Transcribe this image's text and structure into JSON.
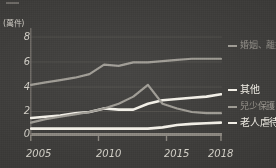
{
  "axis": {
    "unit_label": "(萬件)",
    "y_ticks": [
      "8",
      "6",
      "4",
      "2",
      "0"
    ],
    "x_ticks": [
      "2005",
      "2010",
      "2015",
      "2018"
    ]
  },
  "legend": {
    "marriage": "婚姻、離婚或同居關係暴力",
    "other": "其他",
    "child": "兒少保護",
    "elder": "老人虐待"
  },
  "colors": {
    "background": "#3d3c3a",
    "marriage_line": "#9d9a93",
    "other_line": "#f2efe7",
    "child_line": "#9d9a93",
    "elder_line": "#f2efe7",
    "axis_line": "#85817b",
    "grid_line": "#4a4845",
    "tick_text": "#cfccc4"
  },
  "chart_data": {
    "type": "line",
    "title": "",
    "xlabel": "",
    "ylabel": "",
    "unit": "萬件",
    "grid": true,
    "legend_position": "right",
    "xlim": [
      2005,
      2018
    ],
    "ylim": [
      0,
      9
    ],
    "x": [
      2005,
      2006,
      2007,
      2008,
      2009,
      2010,
      2011,
      2012,
      2013,
      2014,
      2015,
      2016,
      2017,
      2018
    ],
    "series": [
      {
        "name": "婚姻、離婚或同居關係暴力",
        "color": "#9d9a93",
        "values": [
          4.2,
          4.4,
          4.6,
          4.8,
          5.1,
          5.9,
          5.8,
          6.1,
          6.1,
          6.2,
          6.3,
          6.4,
          6.4,
          6.4
        ]
      },
      {
        "name": "其他",
        "color": "#f2efe7",
        "values": [
          1.4,
          1.5,
          1.6,
          1.8,
          1.9,
          2.2,
          2.1,
          2.1,
          2.6,
          2.9,
          3.0,
          3.1,
          3.2,
          3.4
        ]
      },
      {
        "name": "兒少保護",
        "color": "#9d9a93",
        "values": [
          1.0,
          1.3,
          1.5,
          1.7,
          1.9,
          2.2,
          2.6,
          3.2,
          4.2,
          2.6,
          2.2,
          1.9,
          1.8,
          1.8
        ]
      },
      {
        "name": "老人虐待",
        "color": "#f2efe7",
        "values": [
          0.5,
          0.5,
          0.5,
          0.5,
          0.5,
          0.5,
          0.5,
          0.5,
          0.5,
          0.6,
          0.8,
          0.9,
          0.95,
          1.0
        ]
      }
    ]
  }
}
